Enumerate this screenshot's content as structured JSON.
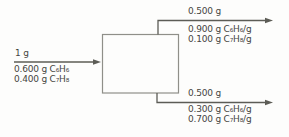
{
  "colors": {
    "background": "#fdfdfc",
    "line": "#5c5c56",
    "box_border": "#8f8f89",
    "text": "#45453f"
  },
  "streams": {
    "feed": {
      "total": "1 g",
      "components": [
        "0.600 g C₆H₆",
        "0.400 g C₇H₈"
      ]
    },
    "overhead": {
      "total": "0.500 g",
      "components": [
        "0.900 g C₆H₆/g",
        "0.100 g C₇H₈/g"
      ]
    },
    "bottoms": {
      "total": "0.500 g",
      "components": [
        "0.300 g C₆H₆/g",
        "0.700 g C₇H₈/g"
      ]
    }
  }
}
